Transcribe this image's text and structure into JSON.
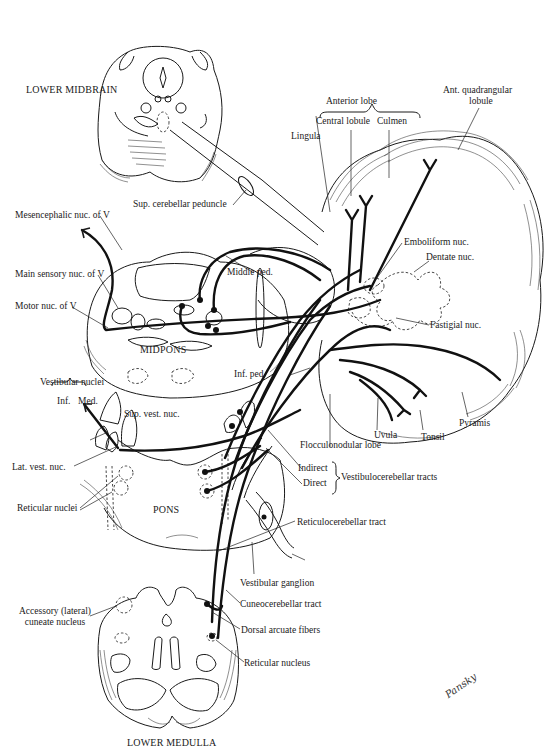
{
  "figure": {
    "type": "anatomical-diagram",
    "signature": "Pansky",
    "sections": {
      "lower_midbrain": "LOWER MIDBRAIN",
      "midpons": "MIDPONS",
      "pons": "PONS",
      "lower_medulla": "LOWER MEDULLA"
    },
    "labels": {
      "anterior_lobe": "Anterior lobe",
      "central_lobule": "Central lobule",
      "culmen": "Culmen",
      "lingula": "Lingula",
      "ant_quadrangular_1": "Ant. quadrangular",
      "ant_quadrangular_2": "lobule",
      "sup_cerebellar_peduncle": "Sup. cerebellar peduncle",
      "mesencephalic_nuc": "Mesencephalic nuc. of V",
      "main_sensory_nuc": "Main sensory nuc. of V",
      "motor_nuc": "Motor nuc. of V",
      "middle_ped": "Middle ped.",
      "emboliform_nuc": "Emboliform nuc.",
      "dentate_nuc": "Dentate nuc.",
      "fastigial_nuc": "Fastigial nuc.",
      "inf_ped": "Inf. ped.",
      "vestibular_nuclei": "Vestibular nuclei",
      "inf": "Inf.",
      "med": "Med.",
      "sup_vest_nuc": "Sup. vest. nuc.",
      "lat_vest_nuc": "Lat. vest. nuc.",
      "reticular_nuclei": "Reticular nuclei",
      "uvula": "Uvula",
      "tonsil": "Tonsil",
      "pyramis": "Pyramis",
      "flocculonodular_lobe": "Flocculonodular lobe",
      "indirect": "Indirect",
      "direct": "Direct",
      "vestibulocerebellar_tracts": "Vestibulocerebellar tracts",
      "reticulocerebellar_tract": "Reticulocerebellar tract",
      "vestibular_ganglion": "Vestibular ganglion",
      "cuneocerebellar_tract": "Cuneocerebellar tract",
      "dorsal_arcuate_fibers": "Dorsal arcuate fibers",
      "accessory_cuneate_1": "Accessory (lateral)",
      "accessory_cuneate_2": "cuneate nucleus",
      "reticular_nucleus": "Reticular nucleus"
    },
    "colors": {
      "background": "#ffffff",
      "ink": "#1a1a1a"
    }
  }
}
